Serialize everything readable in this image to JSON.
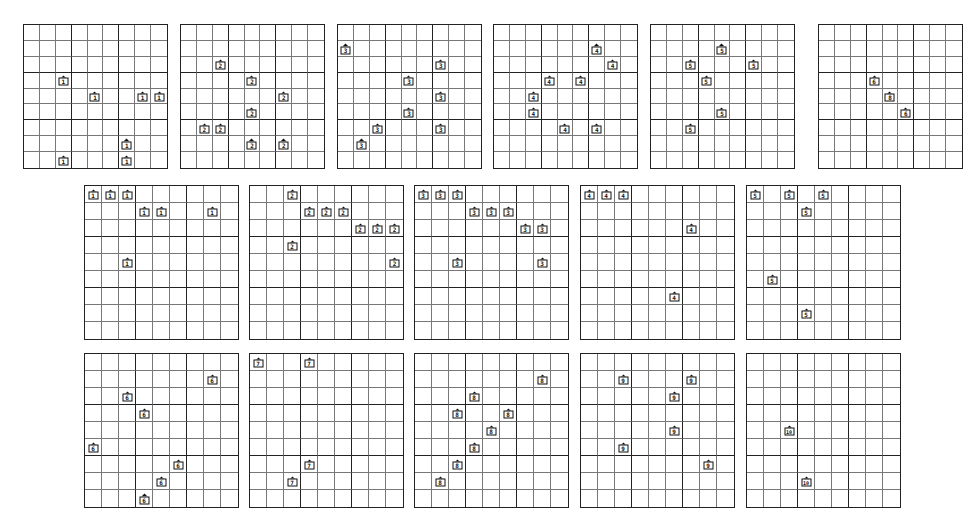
{
  "figure": {
    "boards": [
      {
        "id": 1,
        "x": 23,
        "y": 24,
        "size": 145,
        "label": "1",
        "pieces": [
          [
            3,
            2
          ],
          [
            4,
            4
          ],
          [
            4,
            7
          ],
          [
            4,
            8
          ],
          [
            7,
            6
          ],
          [
            8,
            2
          ],
          [
            8,
            6
          ]
        ]
      },
      {
        "id": 2,
        "x": 180,
        "y": 24,
        "size": 145,
        "label": "2",
        "pieces": [
          [
            2,
            2
          ],
          [
            3,
            4
          ],
          [
            4,
            6
          ],
          [
            5,
            4
          ],
          [
            6,
            1
          ],
          [
            6,
            2
          ],
          [
            7,
            4
          ],
          [
            7,
            6
          ]
        ]
      },
      {
        "id": 3,
        "x": 337,
        "y": 24,
        "size": 145,
        "label": "3",
        "pieces": [
          [
            1,
            0
          ],
          [
            2,
            6
          ],
          [
            3,
            4
          ],
          [
            4,
            6
          ],
          [
            5,
            4
          ],
          [
            6,
            2
          ],
          [
            6,
            6
          ],
          [
            7,
            1
          ]
        ]
      },
      {
        "id": 4,
        "x": 493,
        "y": 24,
        "size": 145,
        "label": "4",
        "pieces": [
          [
            1,
            6
          ],
          [
            2,
            7
          ],
          [
            3,
            3
          ],
          [
            3,
            5
          ],
          [
            4,
            2
          ],
          [
            5,
            2
          ],
          [
            6,
            4
          ],
          [
            6,
            6
          ]
        ]
      },
      {
        "id": 5,
        "x": 650,
        "y": 24,
        "size": 145,
        "label": "5",
        "pieces": [
          [
            1,
            4
          ],
          [
            2,
            2
          ],
          [
            2,
            6
          ],
          [
            3,
            3
          ],
          [
            5,
            4
          ],
          [
            6,
            2
          ]
        ]
      },
      {
        "id": 6,
        "x": 818,
        "y": 24,
        "size": 145,
        "labels": [
          "6",
          "8",
          "6"
        ],
        "pieces": [
          [
            3,
            3
          ],
          [
            4,
            4
          ],
          [
            5,
            5
          ]
        ]
      },
      {
        "id": 7,
        "x": 84,
        "y": 185,
        "size": 155,
        "label": "1",
        "pieces": [
          [
            0,
            0
          ],
          [
            0,
            1
          ],
          [
            0,
            2
          ],
          [
            1,
            3
          ],
          [
            1,
            4
          ],
          [
            1,
            7
          ],
          [
            4,
            2
          ]
        ]
      },
      {
        "id": 8,
        "x": 249,
        "y": 185,
        "size": 155,
        "label": "2",
        "pieces": [
          [
            0,
            2
          ],
          [
            1,
            3
          ],
          [
            1,
            4
          ],
          [
            1,
            5
          ],
          [
            2,
            6
          ],
          [
            2,
            7
          ],
          [
            2,
            8
          ],
          [
            3,
            2
          ],
          [
            4,
            8
          ]
        ]
      },
      {
        "id": 9,
        "x": 414,
        "y": 185,
        "size": 155,
        "label": "3",
        "pieces": [
          [
            0,
            0
          ],
          [
            0,
            1
          ],
          [
            0,
            2
          ],
          [
            1,
            3
          ],
          [
            1,
            4
          ],
          [
            1,
            5
          ],
          [
            2,
            6
          ],
          [
            2,
            7
          ],
          [
            4,
            2
          ],
          [
            4,
            7
          ]
        ]
      },
      {
        "id": 10,
        "x": 580,
        "y": 185,
        "size": 155,
        "label": "4",
        "pieces": [
          [
            0,
            0
          ],
          [
            0,
            1
          ],
          [
            0,
            2
          ],
          [
            2,
            6
          ],
          [
            6,
            5
          ]
        ]
      },
      {
        "id": 11,
        "x": 746,
        "y": 185,
        "size": 155,
        "label": "5",
        "pieces": [
          [
            0,
            0
          ],
          [
            0,
            2
          ],
          [
            0,
            4
          ],
          [
            1,
            3
          ],
          [
            5,
            1
          ],
          [
            7,
            3
          ]
        ]
      },
      {
        "id": 12,
        "x": 84,
        "y": 353,
        "size": 155,
        "label": "6",
        "pieces": [
          [
            1,
            7
          ],
          [
            2,
            2
          ],
          [
            3,
            3
          ],
          [
            5,
            0
          ],
          [
            6,
            5
          ],
          [
            7,
            4
          ],
          [
            8,
            3
          ]
        ]
      },
      {
        "id": 13,
        "x": 249,
        "y": 353,
        "size": 155,
        "label": "7",
        "pieces": [
          [
            0,
            0
          ],
          [
            0,
            3
          ],
          [
            6,
            3
          ],
          [
            7,
            2
          ]
        ]
      },
      {
        "id": 14,
        "x": 414,
        "y": 353,
        "size": 155,
        "label": "8",
        "pieces": [
          [
            1,
            7
          ],
          [
            2,
            3
          ],
          [
            3,
            2
          ],
          [
            3,
            5
          ],
          [
            4,
            4
          ],
          [
            5,
            3
          ],
          [
            6,
            2
          ],
          [
            7,
            1
          ]
        ]
      },
      {
        "id": 15,
        "x": 580,
        "y": 353,
        "size": 155,
        "label": "9",
        "pieces": [
          [
            1,
            2
          ],
          [
            1,
            6
          ],
          [
            2,
            5
          ],
          [
            4,
            5
          ],
          [
            5,
            2
          ],
          [
            6,
            7
          ]
        ]
      },
      {
        "id": 16,
        "x": 746,
        "y": 353,
        "size": 155,
        "label": "10",
        "pieces": [
          [
            4,
            2
          ],
          [
            7,
            3
          ]
        ]
      }
    ],
    "colors": {
      "line": "#222222",
      "thin_line": "#777777",
      "piece": "#111111",
      "background": "#ffffff"
    }
  }
}
